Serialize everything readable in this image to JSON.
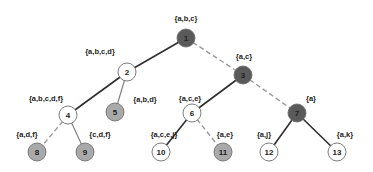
{
  "diagram": {
    "type": "tree",
    "colors": {
      "dark_node": "#5a5a5a",
      "gray_node": "#a9a9a9",
      "white_node": "#ffffff",
      "node_stroke": "#6e6e6e",
      "solid_edge": "#2e2e2e",
      "light_edge": "#7a7a7a",
      "dashed_edge": "#9a9a9a"
    },
    "nodes": [
      {
        "id": "1",
        "x": 186,
        "y": 38,
        "fill": "dark",
        "set": "{a,b,c}",
        "lx": 186,
        "ly": 18,
        "anchor": "middle"
      },
      {
        "id": "2",
        "x": 127,
        "y": 72,
        "fill": "white",
        "set": "{a,b,c,d}",
        "lx": 100,
        "ly": 51,
        "anchor": "middle"
      },
      {
        "id": "3",
        "x": 243,
        "y": 75,
        "fill": "dark",
        "set": "{a,c}",
        "lx": 244,
        "ly": 56,
        "anchor": "middle"
      },
      {
        "id": "4",
        "x": 68,
        "y": 115,
        "fill": "white",
        "set": "{a,b,c,d,f}",
        "lx": 46,
        "ly": 98,
        "anchor": "middle"
      },
      {
        "id": "5",
        "x": 115,
        "y": 112,
        "fill": "gray",
        "set": "{a,b,d}",
        "lx": 145,
        "ly": 99,
        "anchor": "middle"
      },
      {
        "id": "6",
        "x": 192,
        "y": 113,
        "fill": "white",
        "set": "{a,c,e}",
        "lx": 190,
        "ly": 98,
        "anchor": "middle"
      },
      {
        "id": "7",
        "x": 297,
        "y": 113,
        "fill": "dark",
        "set": "{a}",
        "lx": 311,
        "ly": 98,
        "anchor": "middle"
      },
      {
        "id": "8",
        "x": 37,
        "y": 152,
        "fill": "gray",
        "set": "{a,d,f}",
        "lx": 27,
        "ly": 134,
        "anchor": "middle"
      },
      {
        "id": "9",
        "x": 85,
        "y": 152,
        "fill": "gray",
        "set": "{c,d,f}",
        "lx": 100,
        "ly": 134,
        "anchor": "middle"
      },
      {
        "id": "10",
        "x": 161,
        "y": 152,
        "fill": "white",
        "set": "{a,c,e,j}",
        "lx": 164,
        "ly": 134,
        "anchor": "middle"
      },
      {
        "id": "11",
        "x": 223,
        "y": 152,
        "fill": "gray",
        "set": "{a,e}",
        "lx": 225,
        "ly": 134,
        "anchor": "middle"
      },
      {
        "id": "12",
        "x": 269,
        "y": 152,
        "fill": "white",
        "set": "{a,j}",
        "lx": 264,
        "ly": 134,
        "anchor": "middle"
      },
      {
        "id": "13",
        "x": 337,
        "y": 152,
        "fill": "white",
        "set": "{a,k}",
        "lx": 345,
        "ly": 134,
        "anchor": "middle"
      }
    ],
    "edges": [
      {
        "from": "1",
        "to": "2",
        "style": "solid"
      },
      {
        "from": "1",
        "to": "3",
        "style": "dashed"
      },
      {
        "from": "2",
        "to": "4",
        "style": "solid"
      },
      {
        "from": "2",
        "to": "5",
        "style": "light"
      },
      {
        "from": "3",
        "to": "6",
        "style": "solid"
      },
      {
        "from": "3",
        "to": "7",
        "style": "dashed"
      },
      {
        "from": "4",
        "to": "8",
        "style": "dashed"
      },
      {
        "from": "4",
        "to": "9",
        "style": "light"
      },
      {
        "from": "6",
        "to": "10",
        "style": "solid"
      },
      {
        "from": "6",
        "to": "11",
        "style": "dashed"
      },
      {
        "from": "7",
        "to": "12",
        "style": "solid"
      },
      {
        "from": "7",
        "to": "13",
        "style": "solid"
      }
    ],
    "node_radius": 9
  }
}
